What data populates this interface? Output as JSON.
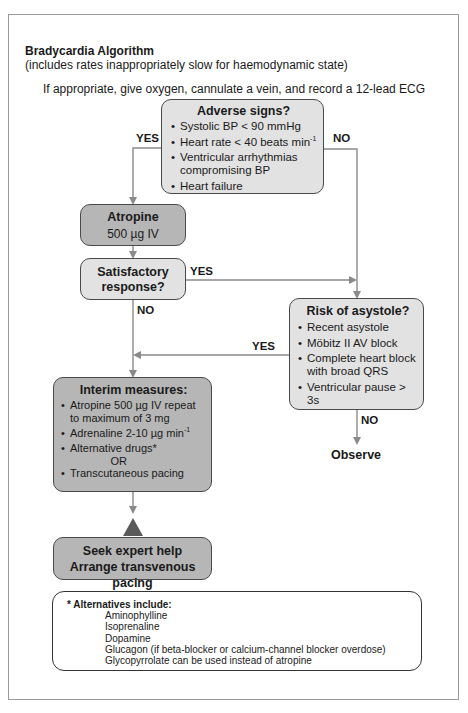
{
  "header": {
    "title": "Bradycardia Algorithm",
    "subtitle": "(includes rates inappropriately slow for haemodynamic state)",
    "intro": "If appropriate, give oxygen, cannulate a vein, and record a 12-lead ECG"
  },
  "adverse_signs": {
    "title": "Adverse signs?",
    "items": [
      "Systolic BP < 90 mmHg",
      "Heart rate < 40 beats min",
      "Ventricular arrhythmias compromising BP",
      "Heart failure"
    ],
    "superscript": "-1",
    "yes_label": "YES",
    "no_label": "NO"
  },
  "atropine": {
    "title": "Atropine",
    "dose": "500 µg IV"
  },
  "satisfactory": {
    "title_line1": "Satisfactory",
    "title_line2": "response?",
    "yes_label": "YES",
    "no_label": "NO"
  },
  "risk_asystole": {
    "title": "Risk of asystole?",
    "items": [
      "Recent asystole",
      "Möbitz II AV block",
      "Complete heart block with broad QRS",
      "Ventricular pause > 3s"
    ],
    "yes_label": "YES",
    "no_label": "NO",
    "outcome": "Observe"
  },
  "interim": {
    "title": "Interim measures:",
    "items": [
      "Atropine 500 µg IV repeat to maximum of 3 mg",
      "Adrenaline 2-10 µg min",
      "Alternative drugs*",
      "OR",
      "Transcutaneous pacing"
    ],
    "superscript": "-1"
  },
  "expert": {
    "line1": "Seek expert help",
    "line2": "Arrange transvenous pacing"
  },
  "alternatives": {
    "heading": "* Alternatives include:",
    "items": [
      "Aminophylline",
      "Isoprenaline",
      "Dopamine",
      "Glucagon (if beta-blocker or calcium-channel blocker overdose)",
      "Glycopyrrolate can be used instead of atropine"
    ]
  },
  "colors": {
    "light_fill": "#e2e2e2",
    "mid_fill": "#b6b6b6",
    "arrow": "#8a8a8a",
    "triangle": "#5a5a5a",
    "border": "#4a4a4a"
  }
}
